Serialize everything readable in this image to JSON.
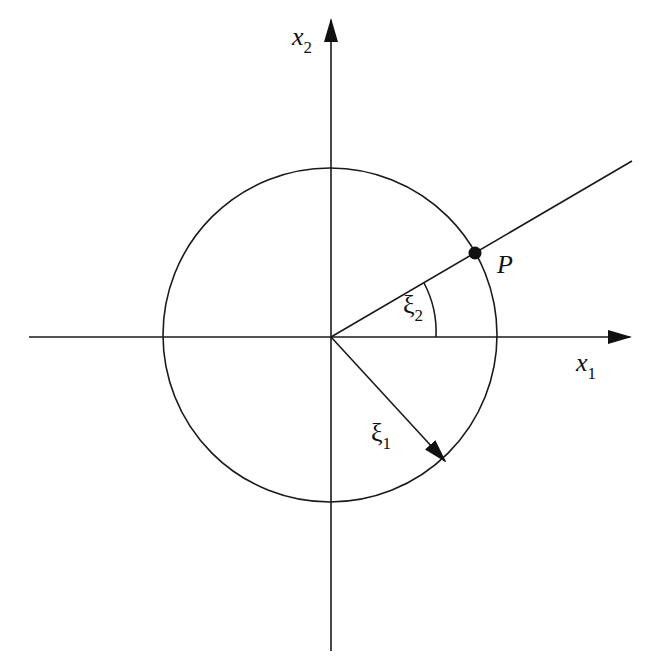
{
  "figure": {
    "type": "polar coordinate diagram",
    "stroke_color": "#1a1a1a",
    "background": "#ffffff"
  },
  "axes": {
    "x1": {
      "symbol": "x",
      "subscript": "1"
    },
    "x2": {
      "symbol": "x",
      "subscript": "2"
    }
  },
  "vectors": {
    "xi1": {
      "symbol": "ξ",
      "subscript": "1"
    }
  },
  "angle": {
    "xi2": {
      "symbol": "ξ",
      "subscript": "2"
    }
  },
  "point": {
    "label": "P"
  }
}
